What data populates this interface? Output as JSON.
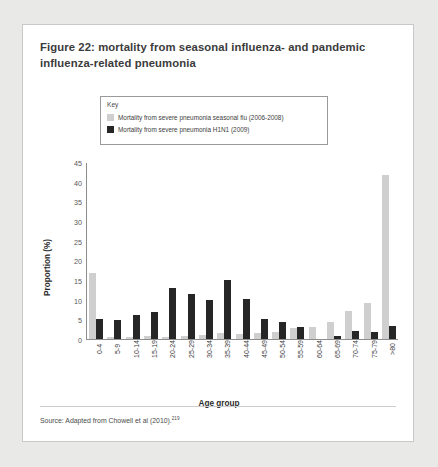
{
  "figure": {
    "title": "Figure 22: mortality from seasonal influenza- and pandemic influenza-related pneumonia",
    "source_text": "Source: Adapted from Chowell et al (2010).",
    "source_superscript": "219"
  },
  "legend": {
    "title": "Key",
    "entries": [
      {
        "label": "Mortality from severe pneumonia seasonal flu (2006-2008)",
        "color": "#cfcfcf"
      },
      {
        "label": "Mortality from severe pneumonia H1N1 (2009)",
        "color": "#262626"
      }
    ]
  },
  "chart_data": {
    "type": "bar",
    "title": "Figure 22: mortality from seasonal influenza- and pandemic influenza-related pneumonia",
    "xlabel": "Age group",
    "ylabel": "Proportion (%)",
    "ylim": [
      0,
      45
    ],
    "yticks": [
      0,
      5,
      10,
      15,
      20,
      25,
      30,
      35,
      40,
      45
    ],
    "grid": false,
    "legend_position": "top-inside-box",
    "categories": [
      "0-4",
      "5-9",
      "10-14",
      "15-19",
      "20-24",
      "25-29",
      "30-34",
      "35-39",
      "40-44",
      "45-49",
      "50-54",
      "55-59",
      "60-64",
      "65-69",
      "70-74",
      "75-79",
      ">80"
    ],
    "series": [
      {
        "name": "Mortality from severe pneumonia seasonal flu (2006-2008)",
        "color": "#cfcfcf",
        "values": [
          17.0,
          0.6,
          0.6,
          0.7,
          0.6,
          0.7,
          0.9,
          1.6,
          1.3,
          1.5,
          1.7,
          2.9,
          3.0,
          4.3,
          7.1,
          9.1,
          42.0
        ]
      },
      {
        "name": "Mortality from severe pneumonia H1N1 (2009)",
        "color": "#262626",
        "values": [
          5.0,
          4.9,
          6.1,
          7.0,
          13.0,
          11.6,
          10.0,
          15.0,
          10.2,
          5.0,
          4.3,
          3.0,
          0.0,
          0.8,
          2.0,
          1.8,
          3.3
        ]
      }
    ]
  }
}
